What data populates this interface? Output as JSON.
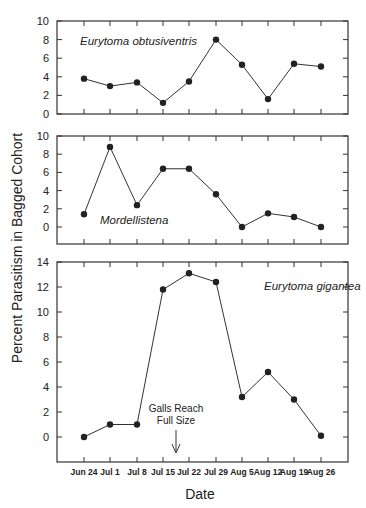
{
  "chart_data": {
    "type": "line",
    "ylabel": "Percent Parasitism in Bagged Cohort",
    "xlabel": "Date",
    "categories": [
      "Jun 24",
      "Jul 1",
      "Jul 8",
      "Jul 15",
      "Jul 22",
      "Jul 29",
      "Aug 5",
      "Aug 12",
      "Aug 19",
      "Aug 26"
    ],
    "panels": [
      {
        "title": "Eurytoma obtusiventris",
        "ylim": [
          0,
          10
        ],
        "yticks": [
          0,
          2,
          4,
          6,
          8,
          10
        ],
        "values": [
          3.8,
          3.0,
          3.4,
          1.2,
          3.5,
          8.0,
          5.3,
          1.6,
          5.4,
          5.1
        ]
      },
      {
        "title": "Mordellistena",
        "ylim": [
          -1.5,
          10
        ],
        "yticks": [
          0,
          2,
          4,
          6,
          8,
          10
        ],
        "values": [
          1.4,
          8.8,
          2.4,
          6.4,
          6.4,
          3.6,
          0.0,
          1.5,
          1.1,
          0.0
        ]
      },
      {
        "title": "Eurytoma gigantea",
        "ylim": [
          -2,
          14
        ],
        "yticks": [
          0,
          2,
          4,
          6,
          8,
          10,
          12,
          14
        ],
        "values": [
          0.0,
          1.0,
          1.0,
          11.8,
          13.1,
          12.4,
          3.2,
          5.2,
          3.0,
          0.1
        ]
      }
    ],
    "annotations": [
      {
        "text_line1": "Galls Reach",
        "text_line2": "Full Size",
        "x_position": "between Jul 15 and Jul 22",
        "marker": "down-arrow"
      }
    ],
    "grid": false,
    "legend": "none (panel labels inside plots)"
  },
  "labels": {
    "ylabel": "Percent Parasitism in Bagged Cohort",
    "xlabel": "Date",
    "annot1": "Galls Reach",
    "annot2": "Full Size"
  }
}
